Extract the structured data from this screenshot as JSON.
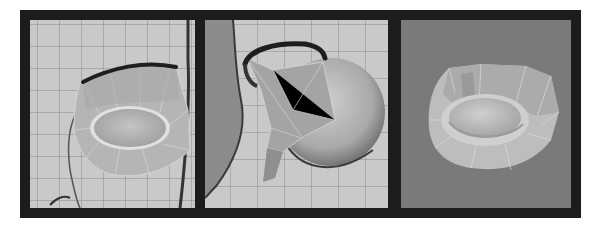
{
  "figure": {
    "panel_count": 3,
    "frame_color": "#1c1c1c",
    "panels": [
      {
        "id": "front-view",
        "description": "eyelid mesh over reference image, front view",
        "background": "#c9c9c9",
        "grid": true,
        "grid_color": "#8a8a8a"
      },
      {
        "id": "side-view",
        "description": "eyelid mesh wrapped around eyeball sphere, side view",
        "background": "#c9c9c9",
        "grid": true,
        "grid_color": "#8a8a8a"
      },
      {
        "id": "perspective-view",
        "description": "eyelid mesh shaded, perspective view",
        "background": "#7a7a7a",
        "grid": false
      }
    ]
  }
}
